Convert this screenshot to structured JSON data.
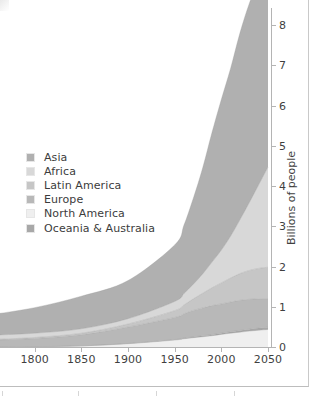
{
  "figure": {
    "name": "world-population-by-region-stacked-area",
    "panel_background": "#ffffff",
    "axis_color": "#b4b4b4",
    "text_color": "#3c3c3c"
  },
  "legend": {
    "position": "inside-left",
    "items": [
      {
        "label": "Asia",
        "color": "#b0b0b0",
        "swatch": "legend-swatch-asia"
      },
      {
        "label": "Africa",
        "color": "#d8d8d8",
        "swatch": "legend-swatch-africa"
      },
      {
        "label": "Latin America",
        "color": "#c6c6c6",
        "swatch": "legend-swatch-latin-america"
      },
      {
        "label": "Europe",
        "color": "#b8b8b8",
        "swatch": "legend-swatch-europe"
      },
      {
        "label": "North America",
        "color": "#efefef",
        "swatch": "legend-swatch-north-america"
      },
      {
        "label": "Oceania & Australia",
        "color": "#a8a8a8",
        "swatch": "legend-swatch-oceania-australia"
      }
    ]
  },
  "axes": {
    "x": {
      "label": "",
      "ticks": [
        "50",
        "1800",
        "1850",
        "1900",
        "1950",
        "2000",
        "2050"
      ],
      "tick_values": [
        1750,
        1800,
        1850,
        1900,
        1950,
        2000,
        2050
      ],
      "range": [
        1750,
        2050
      ],
      "note_first_tick_clipped": "1750 clipped by crop, shows as 50"
    },
    "y": {
      "label": "Billions of people",
      "ticks": [
        "0",
        "1",
        "2",
        "3",
        "4",
        "5",
        "6",
        "7",
        "8"
      ],
      "tick_values": [
        0,
        1,
        2,
        3,
        4,
        5,
        6,
        7,
        8
      ],
      "range": [
        0,
        8.8
      ],
      "side": "right"
    }
  },
  "chart_data": {
    "type": "area",
    "title": "",
    "subtitle": "",
    "xlabel": "",
    "ylabel": "Billions of people",
    "xlim": [
      1750,
      2050
    ],
    "ylim": [
      0,
      8.8
    ],
    "grid": false,
    "legend_position": "inside-left",
    "stacked": true,
    "stack_order_bottom_to_top": [
      "North America",
      "Oceania & Australia",
      "Europe",
      "Latin America",
      "Africa",
      "Asia"
    ],
    "x": [
      1750,
      1800,
      1850,
      1900,
      1950,
      1960,
      1970,
      1980,
      1990,
      2000,
      2010,
      2020,
      2030,
      2040,
      2050
    ],
    "series": [
      {
        "name": "North America",
        "color": "#efefef",
        "values": [
          0.002,
          0.007,
          0.026,
          0.082,
          0.172,
          0.204,
          0.231,
          0.254,
          0.28,
          0.313,
          0.343,
          0.369,
          0.395,
          0.417,
          0.435
        ]
      },
      {
        "name": "Oceania & Australia",
        "color": "#a8a8a8",
        "values": [
          0.002,
          0.002,
          0.002,
          0.006,
          0.013,
          0.016,
          0.02,
          0.023,
          0.027,
          0.031,
          0.037,
          0.043,
          0.048,
          0.053,
          0.057
        ]
      },
      {
        "name": "Europe",
        "color": "#b8b8b8",
        "values": [
          0.163,
          0.203,
          0.276,
          0.408,
          0.549,
          0.605,
          0.657,
          0.694,
          0.721,
          0.727,
          0.737,
          0.748,
          0.741,
          0.728,
          0.71
        ]
      },
      {
        "name": "Latin America",
        "color": "#c6c6c6",
        "values": [
          0.016,
          0.024,
          0.038,
          0.074,
          0.169,
          0.22,
          0.288,
          0.364,
          0.443,
          0.522,
          0.597,
          0.664,
          0.718,
          0.755,
          0.78
        ]
      },
      {
        "name": "Africa",
        "color": "#d8d8d8",
        "values": [
          0.106,
          0.107,
          0.111,
          0.133,
          0.228,
          0.285,
          0.366,
          0.481,
          0.638,
          0.814,
          1.044,
          1.341,
          1.688,
          2.077,
          2.489
        ]
      },
      {
        "name": "Asia",
        "color": "#b0b0b0",
        "values": [
          0.502,
          0.635,
          0.809,
          0.947,
          1.404,
          1.7,
          2.135,
          2.632,
          3.221,
          3.741,
          4.17,
          4.641,
          4.947,
          5.085,
          5.133
        ]
      }
    ],
    "cumulative_totals": [
      0.791,
      0.978,
      1.262,
      1.65,
      2.536,
      3.03,
      3.697,
      4.448,
      5.33,
      6.148,
      6.928,
      7.806,
      8.537,
      9.115,
      9.604
    ],
    "totals_visible_top_at_2050": 8.6,
    "annotations": []
  }
}
